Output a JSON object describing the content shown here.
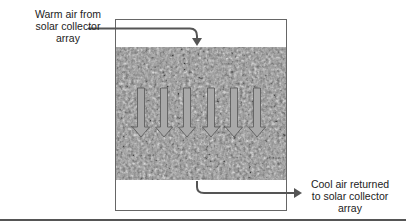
{
  "diagram": {
    "labels": {
      "warm_air": "Warm air from solar collector array",
      "warm_air_lines": [
        "Warm air from",
        "solar collector",
        "array"
      ],
      "cool_air": "Cool air returned to solar collector array",
      "cool_air_lines": [
        "Cool air returned",
        "to solar collector",
        "array"
      ]
    },
    "components": {
      "storage_bin": "rock storage bin",
      "media": "gravel / rock bed",
      "flow_arrows_count": 6
    },
    "colors": {
      "outline": "#555555",
      "arrow_fill": "#a9a9a9",
      "flow_line": "#555555",
      "gravel_base": "#8c8c8c"
    }
  }
}
